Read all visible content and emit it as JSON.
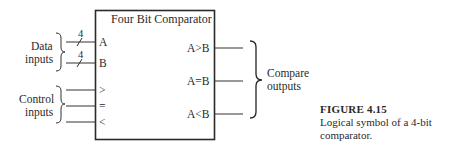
{
  "diagram": {
    "block_title": "Four Bit Comparator",
    "data_inputs": {
      "label_line1": "Data",
      "label_line2": "inputs",
      "pins": [
        {
          "name": "A",
          "bus_width": "4"
        },
        {
          "name": "B",
          "bus_width": "4"
        }
      ]
    },
    "control_inputs": {
      "label_line1": "Control",
      "label_line2": "inputs",
      "pins": [
        {
          "name": ">"
        },
        {
          "name": "="
        },
        {
          "name": "<"
        }
      ]
    },
    "outputs": {
      "label_line1": "Compare",
      "label_line2": "outputs",
      "pins": [
        {
          "name": "A>B"
        },
        {
          "name": "A=B"
        },
        {
          "name": "A<B"
        }
      ]
    }
  },
  "caption": {
    "title": "FIGURE 4.15",
    "line1": "Logical symbol of a 4-bit",
    "line2": "comparator."
  }
}
